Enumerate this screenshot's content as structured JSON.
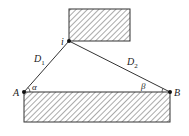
{
  "diagram": {
    "points": {
      "i": {
        "label": "i",
        "x": 69,
        "y": 41
      },
      "A": {
        "label": "A",
        "x": 24,
        "y": 92
      },
      "B": {
        "label": "B",
        "x": 170,
        "y": 92
      }
    },
    "segments": [
      {
        "from": "A",
        "to": "i",
        "label": "D",
        "subscript": "1"
      },
      {
        "from": "i",
        "to": "B",
        "label": "D",
        "subscript": "2"
      }
    ],
    "angles": [
      {
        "at": "A",
        "label": "α"
      },
      {
        "at": "B",
        "label": "β"
      }
    ],
    "blocks": [
      {
        "name": "top-block",
        "x": 69,
        "y": 9,
        "w": 61,
        "h": 32
      },
      {
        "name": "bottom-block",
        "x": 24,
        "y": 92,
        "w": 146,
        "h": 30
      }
    ],
    "colors": {
      "line": "#333333",
      "hatch": "#555555",
      "point": "#111111"
    }
  }
}
